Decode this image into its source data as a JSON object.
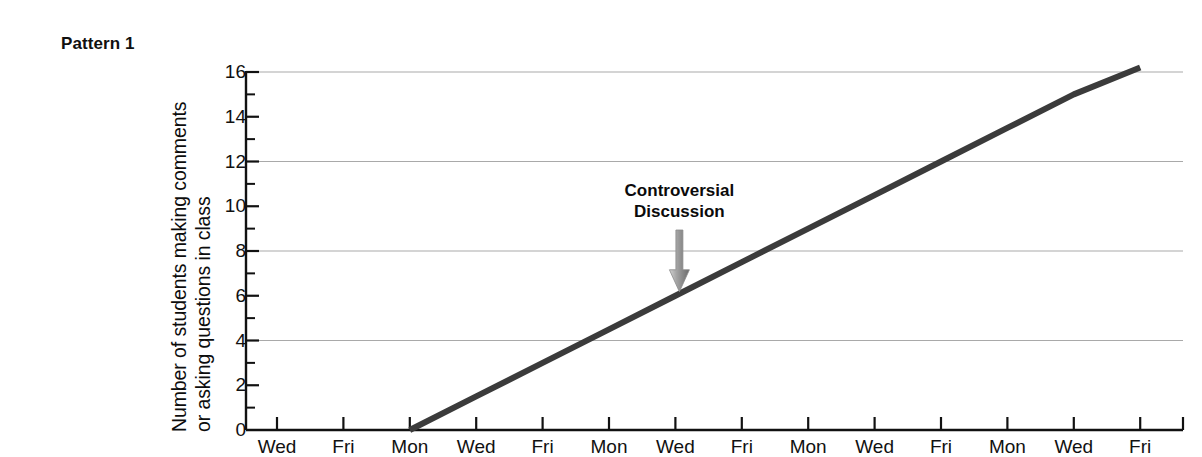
{
  "figure": {
    "pattern_label": "Pattern 1"
  },
  "chart_data": {
    "type": "line",
    "title": "Pattern 1",
    "xlabel": "",
    "ylabel": "Number of students making comments or asking questions in class",
    "ylabel_line1": "Number of students making comments",
    "ylabel_line2": "or asking questions in class",
    "ylim": [
      0,
      16
    ],
    "ytick_values": [
      0,
      2,
      4,
      6,
      8,
      10,
      12,
      14,
      16
    ],
    "ytick_labels": [
      "0",
      "2",
      "4",
      "6",
      "8",
      "10",
      "12",
      "14",
      "16"
    ],
    "minor_ytick_values": [
      1,
      3,
      5,
      7,
      9,
      11,
      13,
      15
    ],
    "gridlines_at": [
      4,
      8,
      12,
      16
    ],
    "grid": true,
    "legend": "none",
    "categories": [
      "Wed",
      "Fri",
      "Mon",
      "Wed",
      "Fri",
      "Mon",
      "Wed",
      "Fri",
      "Mon",
      "Wed",
      "Fri",
      "Mon",
      "Wed",
      "Fri"
    ],
    "series": [
      {
        "name": "Students participating",
        "x_indices": [
          0,
          1,
          2,
          3,
          4,
          5,
          6,
          7,
          8,
          9,
          10,
          11,
          12,
          13
        ],
        "values": [
          null,
          null,
          0,
          1.5,
          3.0,
          4.5,
          6.0,
          7.5,
          9.0,
          10.5,
          12.0,
          13.5,
          15.0,
          16.2
        ],
        "color": "#3b3b3b",
        "line_width": 6
      }
    ],
    "annotations": [
      {
        "text_line1": "Controversial",
        "text_line2": "Discussion",
        "at_category_index": 6,
        "at_value": 6,
        "arrow": "down-arrow",
        "arrow_color": "#8c8c8c"
      }
    ]
  },
  "axis_colors": {
    "axis": "#111111",
    "grid": "#a9a9a9",
    "line": "#3b3b3b",
    "arrow_light": "#cfcfcf",
    "arrow_dark": "#6e6e6e"
  }
}
